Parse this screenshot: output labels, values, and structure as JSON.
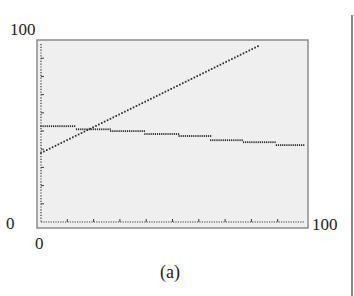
{
  "chart_data": {
    "type": "line",
    "title": "",
    "caption": "(a)",
    "xlabel": "",
    "ylabel": "",
    "xlim": [
      0,
      100
    ],
    "ylim": [
      0,
      100
    ],
    "x_tick_labels": {
      "min": "0",
      "max": "100"
    },
    "y_tick_labels": {
      "min": "0",
      "max": "100"
    },
    "grid": false,
    "legend": null,
    "style": "graphing-calculator dot plot",
    "series": [
      {
        "name": "increasing",
        "description": "linear increasing line",
        "points": [
          [
            0,
            38
          ],
          [
            10,
            45
          ],
          [
            20,
            52
          ],
          [
            30,
            60
          ],
          [
            40,
            67
          ],
          [
            50,
            74
          ],
          [
            60,
            81
          ],
          [
            70,
            88
          ],
          [
            83,
            97
          ]
        ]
      },
      {
        "name": "decreasing-step",
        "description": "slowly decreasing step function",
        "steps": [
          {
            "x_start": 0,
            "x_end": 13.5,
            "y": 52.7
          },
          {
            "x_start": 13.5,
            "x_end": 26.5,
            "y": 51
          },
          {
            "x_start": 26.5,
            "x_end": 39.5,
            "y": 50
          },
          {
            "x_start": 39.5,
            "x_end": 52.5,
            "y": 48.4
          },
          {
            "x_start": 52.5,
            "x_end": 64.5,
            "y": 47.3
          },
          {
            "x_start": 64.5,
            "x_end": 77,
            "y": 45
          },
          {
            "x_start": 77,
            "x_end": 89.5,
            "y": 43.9
          },
          {
            "x_start": 89.5,
            "x_end": 100,
            "y": 42.3
          }
        ]
      }
    ]
  },
  "labels": {
    "y_top": "100",
    "y_bottom": "0",
    "x_left": "0",
    "x_right": "100",
    "caption": "(a)"
  },
  "colors": {
    "plot_background": "#efefef",
    "frame": "#8c8c8c",
    "axis": "#3a3a3a",
    "data": "#2a2a2a"
  }
}
